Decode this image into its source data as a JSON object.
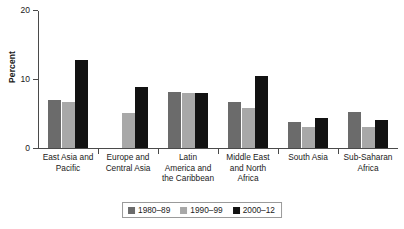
{
  "chart_data": {
    "type": "bar",
    "title": "",
    "xlabel": "",
    "ylabel": "Percent",
    "ylim": [
      0,
      20
    ],
    "yticks": [
      0,
      10,
      20
    ],
    "ytick_labels": [
      "0",
      "10",
      "20"
    ],
    "grid": false,
    "legend_position": "bottom-center",
    "categories": [
      "East Asia and Pacific",
      "Europe and Central Asia",
      "Latin America and the Caribbean",
      "Middle East and North Africa",
      "South Asia",
      "Sub-Saharan Africa"
    ],
    "category_lines": [
      [
        "East Asia and",
        "Pacific"
      ],
      [
        "Europe and",
        "Central Asia"
      ],
      [
        "Latin",
        "America and",
        "the Caribbean"
      ],
      [
        "Middle East",
        "and North",
        "Africa"
      ],
      [
        "South Asia"
      ],
      [
        "Sub-Saharan",
        "Africa"
      ]
    ],
    "series": [
      {
        "name": "1980–89",
        "color": "#6b6b6b",
        "values": [
          7.0,
          null,
          8.1,
          6.6,
          3.7,
          5.2
        ]
      },
      {
        "name": "1990–99",
        "color": "#a8a8a8",
        "values": [
          6.6,
          5.1,
          8.0,
          5.8,
          3.0,
          3.1
        ]
      },
      {
        "name": "2000–12",
        "color": "#121212",
        "values": [
          12.8,
          8.9,
          8.0,
          10.5,
          4.4,
          4.0
        ]
      }
    ]
  },
  "legend": {
    "items": [
      {
        "label": "1980–89",
        "color": "#6b6b6b"
      },
      {
        "label": "1990–99",
        "color": "#a8a8a8"
      },
      {
        "label": "2000–12",
        "color": "#121212"
      }
    ]
  },
  "colors": {
    "axis": "#4a4a4a",
    "text": "#1a1a1a",
    "background": "#ffffff",
    "series_1980_89": "#6b6b6b",
    "series_1990_99": "#a8a8a8",
    "series_2000_12": "#121212"
  }
}
